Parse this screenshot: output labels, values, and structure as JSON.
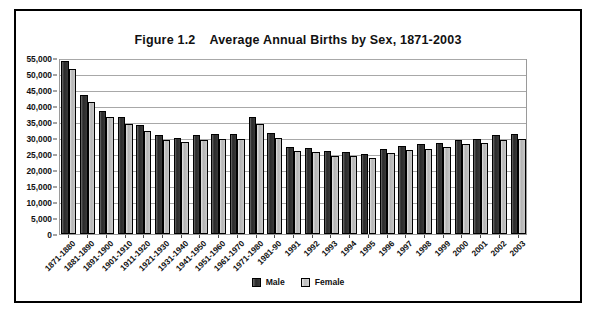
{
  "figure": {
    "label": "Figure 1.2",
    "title": "Average Annual Births by Sex, 1871-2003"
  },
  "legend": {
    "position": "bottom-center",
    "items": [
      {
        "name": "Male",
        "color": "#333333"
      },
      {
        "name": "Female",
        "color": "#c0c0c0"
      }
    ]
  },
  "axis": {
    "y_ticks": [
      "0",
      "5,000",
      "10,000",
      "15,000",
      "20,000",
      "25,000",
      "30,000",
      "35,000",
      "40,000",
      "45,000",
      "50,000",
      "55,000"
    ]
  },
  "colors": {
    "male_bar": "#333333",
    "female_bar": "#c0c0c0",
    "bar_outline": "#000000",
    "gridline": "#a8a8a8",
    "frame": "#000000",
    "plot_border": "#9a9a9a",
    "text": "#111111",
    "background": "#ffffff"
  },
  "chart_data": {
    "type": "bar",
    "xlabel": "",
    "ylabel": "",
    "ylim": [
      0,
      55000
    ],
    "ytick_step": 5000,
    "grid": true,
    "legend_position": "bottom-center",
    "categories": [
      "1871-1880",
      "1881-1890",
      "1891-1900",
      "1901-1910",
      "1911-1920",
      "1921-1930",
      "1931-1940",
      "1941-1950",
      "1951-1960",
      "1961-1970",
      "1971-1980",
      "1981-90",
      "1991",
      "1992",
      "1993",
      "1994",
      "1995",
      "1996",
      "1997",
      "1998",
      "1999",
      "2000",
      "2001",
      "2002",
      "2003"
    ],
    "series": [
      {
        "name": "Male",
        "color": "#333333",
        "values": [
          54000,
          43300,
          38300,
          36500,
          34000,
          31000,
          30100,
          31000,
          31300,
          31200,
          36500,
          31500,
          27300,
          27000,
          25800,
          25700,
          25100,
          26700,
          27600,
          28100,
          28500,
          29500,
          29800,
          31000,
          31200
        ]
      },
      {
        "name": "Female",
        "color": "#c0c0c0",
        "values": [
          51500,
          41300,
          36500,
          34500,
          32300,
          29500,
          28600,
          29400,
          29700,
          29600,
          34500,
          29900,
          26000,
          25600,
          24500,
          24400,
          23800,
          25300,
          26200,
          26700,
          27100,
          28000,
          28300,
          29400,
          29600
        ]
      }
    ]
  }
}
